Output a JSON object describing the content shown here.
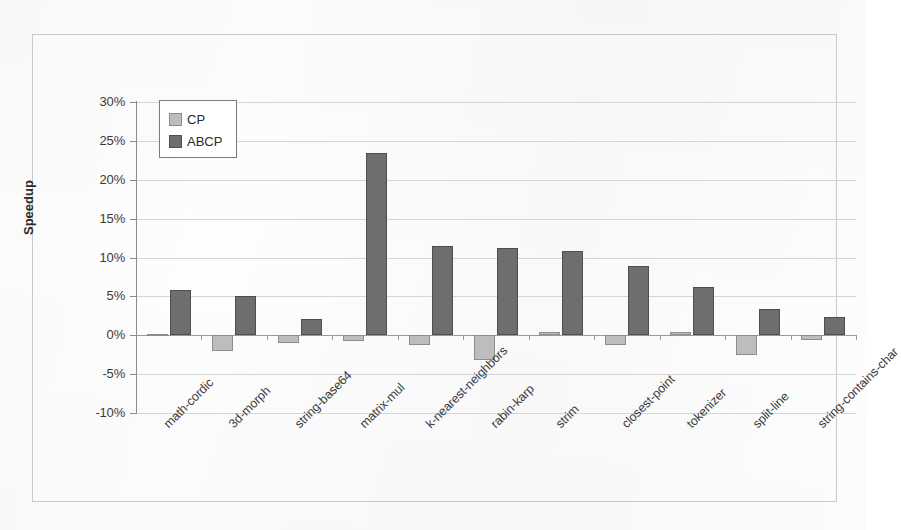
{
  "chart_data": {
    "type": "bar",
    "title": "",
    "xlabel": "",
    "ylabel": "Speedup",
    "ylim": [
      -10,
      30
    ],
    "ytick_step": 5,
    "ytick_labels": [
      "30%",
      "25%",
      "20%",
      "15%",
      "10%",
      "5%",
      "0%",
      "-5%",
      "-10%"
    ],
    "ytick_values": [
      30,
      25,
      20,
      15,
      10,
      5,
      0,
      -5,
      -10
    ],
    "grid": true,
    "legend_position": "top-left inside plot",
    "categories": [
      "math-cordic",
      "3d-morph",
      "string-base64",
      "matrix-mul",
      "k-nearest-neighbors",
      "rabin-karp",
      "strim",
      "closest-point",
      "tokenizer",
      "split-line",
      "string-contains-char"
    ],
    "series": [
      {
        "name": "CP",
        "color": "#bdbdbd",
        "values": [
          0.1,
          -2.0,
          -1.0,
          -0.7,
          -1.2,
          -3.2,
          0.4,
          -1.3,
          0.4,
          -2.5,
          -0.6
        ]
      },
      {
        "name": "ABCP",
        "color": "#6e6e6e",
        "values": [
          5.8,
          5.0,
          2.1,
          23.5,
          11.5,
          11.2,
          10.9,
          8.9,
          6.2,
          3.4,
          2.4
        ]
      }
    ],
    "units": "percent"
  },
  "legend": {
    "items": [
      {
        "label": "CP"
      },
      {
        "label": "ABCP"
      }
    ]
  }
}
